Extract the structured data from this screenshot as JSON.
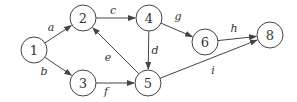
{
  "diagram": {
    "type": "directed-graph",
    "nodes": [
      {
        "id": "1",
        "label": "1",
        "x": 34,
        "y": 50
      },
      {
        "id": "2",
        "label": "2",
        "x": 83,
        "y": 18
      },
      {
        "id": "3",
        "label": "3",
        "x": 83,
        "y": 83
      },
      {
        "id": "4",
        "label": "4",
        "x": 149,
        "y": 18
      },
      {
        "id": "5",
        "label": "5",
        "x": 148,
        "y": 83
      },
      {
        "id": "6",
        "label": "6",
        "x": 205,
        "y": 42
      },
      {
        "id": "8",
        "label": "8",
        "x": 270,
        "y": 35
      }
    ],
    "edges": [
      {
        "label": "a",
        "from": "1",
        "to": "2",
        "lx": 51,
        "ly": 31
      },
      {
        "label": "b",
        "from": "1",
        "to": "3",
        "lx": 44,
        "ly": 75
      },
      {
        "label": "c",
        "from": "2",
        "to": "4",
        "lx": 113,
        "ly": 14
      },
      {
        "label": "e",
        "from": "5",
        "to": "2",
        "lx": 108,
        "ly": 61
      },
      {
        "label": "f",
        "from": "3",
        "to": "5",
        "lx": 106,
        "ly": 95
      },
      {
        "label": "d",
        "from": "4",
        "to": "5",
        "lx": 155,
        "ly": 54
      },
      {
        "label": "g",
        "from": "4",
        "to": "6",
        "lx": 178,
        "ly": 20
      },
      {
        "label": "h",
        "from": "6",
        "to": "8",
        "lx": 234,
        "ly": 32
      },
      {
        "label": "i",
        "from": "5",
        "to": "8",
        "lx": 213,
        "ly": 74
      }
    ]
  }
}
